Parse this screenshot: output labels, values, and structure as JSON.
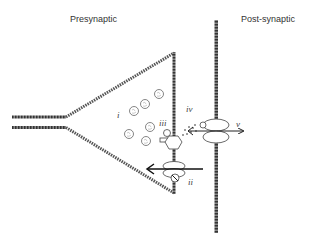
{
  "labels": {
    "presynaptic": "Presynaptic",
    "postsynaptic": "Post-synaptic"
  },
  "markers": {
    "i": "i",
    "ii": "ii",
    "iii": "iii",
    "iv": "iv",
    "v": "v"
  },
  "colors": {
    "membrane": "#555555",
    "stroke": "#222222",
    "background": "#ffffff"
  }
}
